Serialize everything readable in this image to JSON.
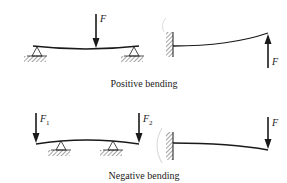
{
  "diagram": {
    "colors": {
      "ink": "#1a1a1a",
      "background": "#ffffff",
      "ghost": "#d8d8d8"
    },
    "captions": {
      "positive": "Positive bending",
      "negative": "Negative bending"
    },
    "labels": {
      "top_simple_force": "F",
      "top_cantilever_force": "F",
      "bottom_left_force_symbol": "F",
      "bottom_left_force_sub": "1",
      "bottom_right_force_symbol": "F",
      "bottom_right_force_sub": "2",
      "bottom_cantilever_force": "F"
    },
    "panels": [
      {
        "id": "positive-simply-supported",
        "type": "simply-supported beam, central downward load"
      },
      {
        "id": "positive-cantilever",
        "type": "cantilever, upward tip load"
      },
      {
        "id": "negative-overhang",
        "type": "overhanging beam, downward end loads"
      },
      {
        "id": "negative-cantilever",
        "type": "cantilever, downward tip load"
      }
    ]
  }
}
